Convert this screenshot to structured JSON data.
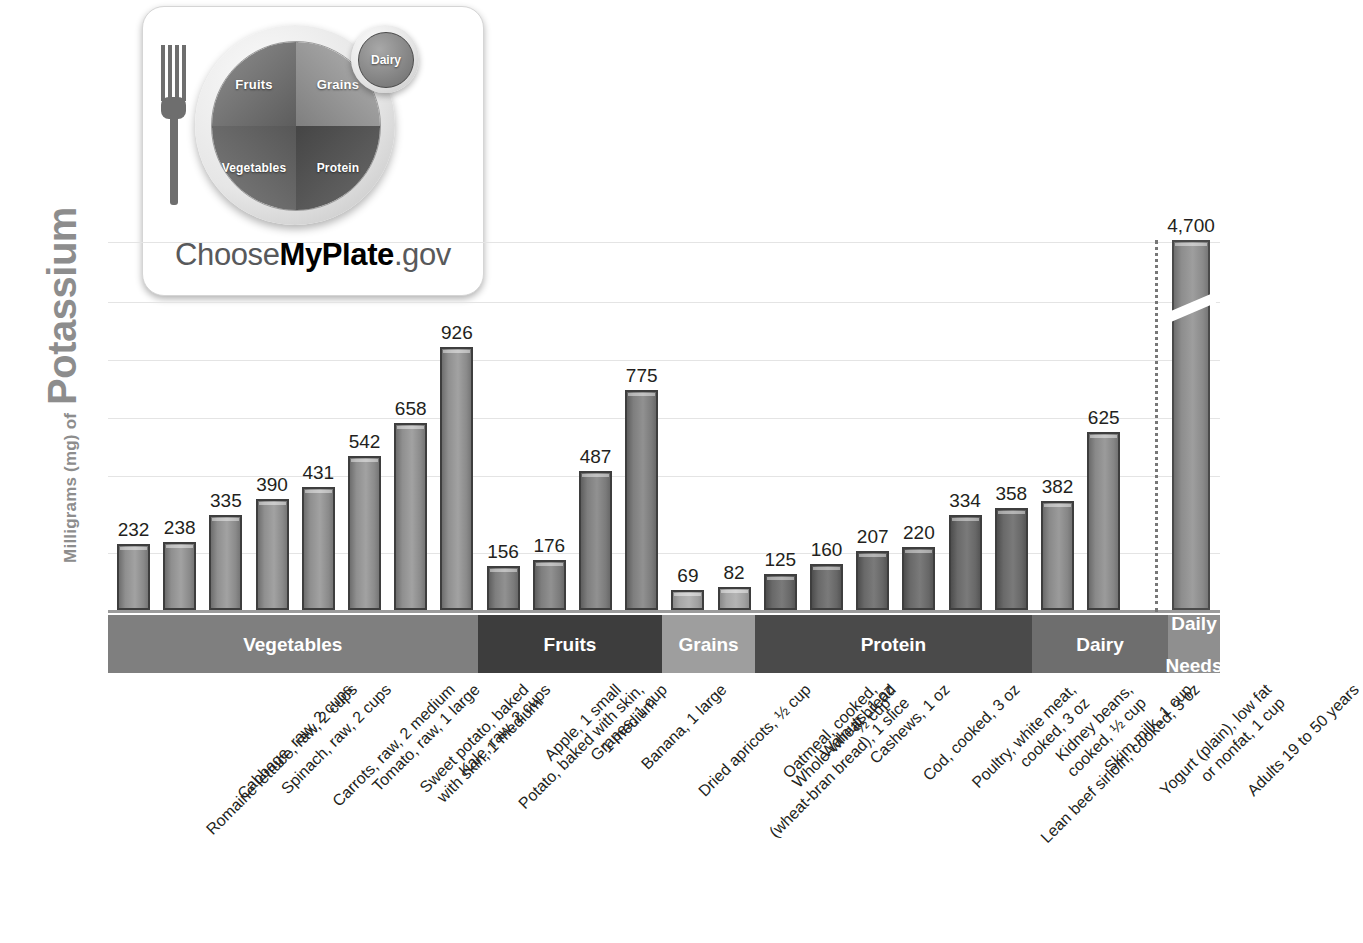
{
  "axis": {
    "y_title_small": "Milligrams (mg) of",
    "y_title_big": "Potassium"
  },
  "logo": {
    "alt": "ChooseMyPlate.gov",
    "text_plain_1": "Choose",
    "text_bold": "MyPlate",
    "text_plain_2": ".gov",
    "segments": {
      "fruits": "Fruits",
      "grains": "Grains",
      "vegetables": "Vegetables",
      "protein": "Protein",
      "dairy": "Dairy"
    }
  },
  "categories": [
    {
      "label": "Vegetables",
      "start": 0,
      "count": 8,
      "color": "#7f7f7f",
      "bar_class": "veg"
    },
    {
      "label": "Fruits",
      "start": 8,
      "count": 4,
      "color": "#3d3d3d",
      "bar_class": "fruit"
    },
    {
      "label": "Grains",
      "start": 12,
      "count": 2,
      "color": "#9e9e9e",
      "bar_class": "grain"
    },
    {
      "label": "Protein",
      "start": 14,
      "count": 6,
      "color": "#4a4a4a",
      "bar_class": "protein"
    },
    {
      "label": "Dairy",
      "start": 20,
      "count": 2,
      "color": "#6e6e6e",
      "bar_class": "dairy"
    },
    {
      "label": "Daily\nNeeds",
      "start": 22,
      "count": 1,
      "color": "#8f8f8f",
      "bar_class": "needs"
    }
  ],
  "chart_data": {
    "type": "bar",
    "title": "Potassium",
    "xlabel": "",
    "ylabel": "Milligrams (mg) of Potassium",
    "ylim": [
      0,
      1100
    ],
    "grid": true,
    "gridline_values": [
      200,
      400,
      600,
      800,
      1000,
      1100
    ],
    "legend": "none",
    "axis_break": {
      "series_index": 22,
      "note": "Daily Needs bar is drawn with a diagonal axis break; true value 4,700 mg"
    },
    "categories": [
      "Romaine lettuce, raw, 2 cups",
      "Cabbage, raw, 2 cups",
      "Spinach, raw, 2 cups",
      "Carrots, raw, 2 medium",
      "Tomato, raw, 1 large",
      "Sweet potato, baked with skin, 1 medium",
      "Kale, raw, 2 cups",
      "Potato, baked with skin, 1 medium",
      "Apple, 1 small",
      "Grapes, 1 cup",
      "Banana, 1 large",
      "Dried apricots, ½ cup",
      "Whole-wheat bread (wheat-bran bread), 1 slice",
      "Oatmeal, cooked, ½ cup",
      "Walnuts, 1 oz",
      "Cashews, 1 oz",
      "Cod, cooked, 3 oz",
      "Poultry, white meat, cooked, 3 oz",
      "Lean beef sirloin, cooked, 3 oz",
      "Kidney beans, cooked, ½ cup",
      "Skim milk, 1 cup",
      "Yogurt (plain), low fat or nonfat, 1 cup",
      "Adults 19 to 50 years"
    ],
    "values": [
      232,
      238,
      335,
      390,
      431,
      542,
      658,
      926,
      156,
      176,
      487,
      775,
      69,
      82,
      125,
      160,
      207,
      220,
      334,
      358,
      382,
      625,
      4700
    ],
    "value_labels": [
      "232",
      "238",
      "335",
      "390",
      "431",
      "542",
      "658",
      "926",
      "156",
      "176",
      "487",
      "775",
      "69",
      "82",
      "125",
      "160",
      "207",
      "220",
      "334",
      "358",
      "382",
      "625",
      "4,700"
    ],
    "group_of": [
      "Vegetables",
      "Vegetables",
      "Vegetables",
      "Vegetables",
      "Vegetables",
      "Vegetables",
      "Vegetables",
      "Vegetables",
      "Fruits",
      "Fruits",
      "Fruits",
      "Fruits",
      "Grains",
      "Grains",
      "Protein",
      "Protein",
      "Protein",
      "Protein",
      "Protein",
      "Protein",
      "Dairy",
      "Dairy",
      "Daily Needs"
    ]
  },
  "tick_labels": [
    [
      "Romaine lettuce, raw, 2 cups"
    ],
    [
      "Cabbage, raw, 2 cups"
    ],
    [
      "Spinach, raw, 2 cups"
    ],
    [
      "Carrots, raw, 2 medium"
    ],
    [
      "Tomato, raw, 1 large"
    ],
    [
      "Sweet potato, baked",
      "with skin, 1 medium"
    ],
    [
      "Kale, raw, 2 cups"
    ],
    [
      "Potato, baked with skin,",
      "1 medium"
    ],
    [
      "Apple, 1 small"
    ],
    [
      "Grapes, 1 cup"
    ],
    [
      "Banana, 1 large"
    ],
    [
      "Dried apricots, ½ cup"
    ],
    [
      "Whole-wheat bread",
      "(wheat-bran bread), 1 slice"
    ],
    [
      "Oatmeal, cooked,",
      "½ cup"
    ],
    [
      "Walnuts, 1 oz"
    ],
    [
      "Cashews, 1 oz"
    ],
    [
      "Cod, cooked, 3 oz"
    ],
    [
      "Poultry, white meat,",
      "cooked, 3 oz"
    ],
    [
      "Lean beef sirloin, cooked, 3 oz"
    ],
    [
      "Kidney beans,",
      "cooked, ½ cup"
    ],
    [
      "Skim milk, 1 cup"
    ],
    [
      "Yogurt (plain), low fat",
      "or nonfat, 1 cup"
    ],
    [
      "Adults 19 to 50 years"
    ]
  ]
}
